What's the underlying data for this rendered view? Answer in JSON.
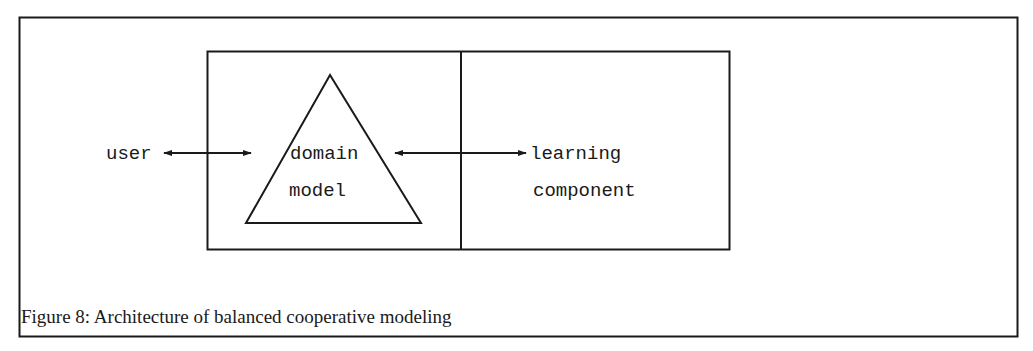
{
  "figure": {
    "caption": "Figure 8: Architecture of balanced cooperative modeling",
    "nodes": {
      "user": "user",
      "domain_model": [
        "domain",
        "model"
      ],
      "learning_component": [
        "learning",
        "component"
      ]
    },
    "edges": [
      {
        "from": "user",
        "to": "domain model",
        "direction": "bidirectional"
      },
      {
        "from": "domain model",
        "to": "learning component",
        "direction": "bidirectional"
      }
    ],
    "colors": {
      "ink": "#1a1a1a",
      "background": "#ffffff"
    }
  }
}
